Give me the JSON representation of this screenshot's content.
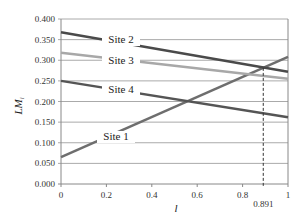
{
  "chart_data": {
    "type": "line",
    "title": "",
    "xlabel": "l",
    "ylabel": "LM_i",
    "ylabel_main": "LM",
    "ylabel_sub": "i",
    "xlim": [
      0,
      1
    ],
    "ylim": [
      0,
      0.4
    ],
    "grid": true,
    "x_ticks": [
      "0",
      "0.2",
      "0.4",
      "0.6",
      "0.8",
      "1"
    ],
    "y_ticks": [
      "0.000",
      "0.050",
      "0.100",
      "0.150",
      "0.200",
      "0.250",
      "0.300",
      "0.350",
      "0.400"
    ],
    "x": [
      0,
      1
    ],
    "series": [
      {
        "name": "Site 1",
        "values": [
          0.065,
          0.308
        ],
        "color": "#6e6e6e"
      },
      {
        "name": "Site 2",
        "values": [
          0.368,
          0.272
        ],
        "color": "#4a4a4a"
      },
      {
        "name": "Site 3",
        "values": [
          0.318,
          0.255
        ],
        "color": "#a8a8a8"
      },
      {
        "name": "Site 4",
        "values": [
          0.25,
          0.162
        ],
        "color": "#555555"
      }
    ],
    "annotations": [
      {
        "type": "dashed-vline",
        "x": 0.891,
        "label": "0.891"
      }
    ]
  }
}
